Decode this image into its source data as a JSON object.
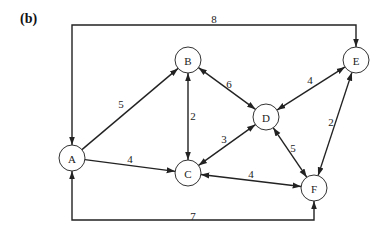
{
  "figure": {
    "label": "(b)"
  },
  "nodes": [
    {
      "id": "A",
      "label": "A",
      "x": 72,
      "y": 158
    },
    {
      "id": "B",
      "label": "B",
      "x": 188,
      "y": 60
    },
    {
      "id": "C",
      "label": "C",
      "x": 188,
      "y": 173
    },
    {
      "id": "D",
      "label": "D",
      "x": 266,
      "y": 117
    },
    {
      "id": "E",
      "label": "E",
      "x": 356,
      "y": 60
    },
    {
      "id": "F",
      "label": "F",
      "x": 314,
      "y": 188
    }
  ],
  "edges": [
    {
      "from": "A",
      "to": "B",
      "weight": "5",
      "direction": "forward",
      "lx": 121,
      "ly": 104
    },
    {
      "from": "A",
      "to": "C",
      "weight": "4",
      "direction": "forward",
      "lx": 130,
      "ly": 159
    },
    {
      "from": "B",
      "to": "C",
      "weight": "2",
      "direction": "both",
      "lx": 193,
      "ly": 116
    },
    {
      "from": "B",
      "to": "D",
      "weight": "6",
      "direction": "both",
      "lx": 229,
      "ly": 84
    },
    {
      "from": "C",
      "to": "D",
      "weight": "3",
      "direction": "both",
      "lx": 224,
      "ly": 139
    },
    {
      "from": "C",
      "to": "F",
      "weight": "4",
      "direction": "both",
      "lx": 251,
      "ly": 174
    },
    {
      "from": "D",
      "to": "E",
      "weight": "4",
      "direction": "both",
      "lx": 310,
      "ly": 80
    },
    {
      "from": "D",
      "to": "F",
      "weight": "5",
      "direction": "both",
      "lx": 293,
      "ly": 148
    },
    {
      "from": "E",
      "to": "F",
      "weight": "2",
      "direction": "both",
      "lx": 331,
      "ly": 122
    },
    {
      "from": "A",
      "to": "E",
      "weight": "8",
      "direction": "both",
      "route": "top",
      "lx": 214,
      "ly": 19
    },
    {
      "from": "A",
      "to": "F",
      "weight": "7",
      "direction": "both",
      "route": "bottom",
      "lx": 193,
      "ly": 216
    }
  ]
}
